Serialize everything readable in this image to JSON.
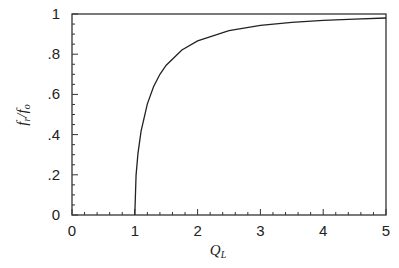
{
  "chart_data": {
    "type": "line",
    "title": "",
    "xlabel": "Q_L",
    "ylabel": "f_r / f_o",
    "xlim": [
      0,
      5
    ],
    "ylim": [
      0,
      1
    ],
    "grid": false,
    "legend": null,
    "x_ticks": [
      "0",
      "1",
      "2",
      "3",
      "4",
      "5"
    ],
    "y_ticks": [
      "0",
      ".2",
      ".4",
      ".6",
      ".8",
      "1"
    ],
    "series": [
      {
        "name": "f_r/f_o",
        "x": [
          1.0,
          1.02,
          1.05,
          1.1,
          1.2,
          1.3,
          1.4,
          1.5,
          1.75,
          2.0,
          2.5,
          3.0,
          3.5,
          4.0,
          4.5,
          5.0
        ],
        "y": [
          0.0,
          0.197,
          0.305,
          0.417,
          0.553,
          0.639,
          0.7,
          0.745,
          0.821,
          0.866,
          0.917,
          0.943,
          0.958,
          0.968,
          0.975,
          0.98
        ]
      }
    ],
    "annotations": []
  },
  "labels": {
    "xlabel_main": "Q",
    "xlabel_sub": "L",
    "ylabel_f1": "f",
    "ylabel_sub1": "r",
    "ylabel_slash": "/",
    "ylabel_f2": "f",
    "ylabel_sub2": "o"
  },
  "colors": {
    "line": "#222222",
    "frame": "#333333"
  }
}
